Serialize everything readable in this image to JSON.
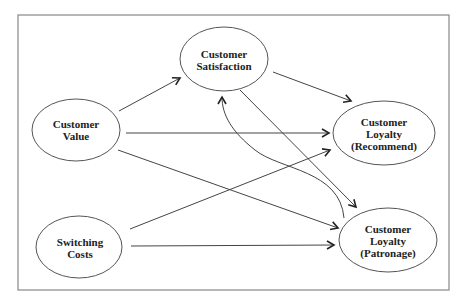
{
  "diagram": {
    "type": "path-model",
    "frame": {
      "x": 18,
      "y": 15,
      "width": 431,
      "height": 275,
      "stroke": "#777777"
    },
    "nodes": [
      {
        "id": "value",
        "lines": [
          "Customer",
          "Value"
        ],
        "cx": 76,
        "cy": 130,
        "rx": 44,
        "ry": 31
      },
      {
        "id": "satisfaction",
        "lines": [
          "Customer",
          "Satisfaction"
        ],
        "cx": 224,
        "cy": 59,
        "rx": 44,
        "ry": 32
      },
      {
        "id": "switching",
        "lines": [
          "Switching",
          "Costs"
        ],
        "cx": 79,
        "cy": 247,
        "rx": 43,
        "ry": 31
      },
      {
        "id": "recommend",
        "lines": [
          "Customer",
          "Loyalty",
          "(Recommend)"
        ],
        "cx": 384,
        "cy": 133,
        "rx": 51,
        "ry": 32
      },
      {
        "id": "patronage",
        "lines": [
          "Customer",
          "Loyalty",
          "(Patronage)"
        ],
        "cx": 388,
        "cy": 240,
        "rx": 49,
        "ry": 32
      }
    ],
    "edges": [
      {
        "from": "value",
        "to": "satisfaction"
      },
      {
        "from": "satisfaction",
        "to": "recommend"
      },
      {
        "from": "value",
        "to": "recommend"
      },
      {
        "from": "satisfaction",
        "to": "patronage"
      },
      {
        "from": "patronage",
        "to": "satisfaction",
        "curved": true
      },
      {
        "from": "switching",
        "to": "recommend"
      },
      {
        "from": "value",
        "to": "patronage"
      },
      {
        "from": "switching",
        "to": "patronage"
      }
    ]
  },
  "labels": {
    "value": {
      "l1": "Customer",
      "l2": "Value"
    },
    "satisfaction": {
      "l1": "Customer",
      "l2": "Satisfaction"
    },
    "switching": {
      "l1": "Switching",
      "l2": "Costs"
    },
    "recommend": {
      "l1": "Customer",
      "l2": "Loyalty",
      "l3": "(Recommend)"
    },
    "patronage": {
      "l1": "Customer",
      "l2": "Loyalty",
      "l3": "(Patronage)"
    }
  }
}
